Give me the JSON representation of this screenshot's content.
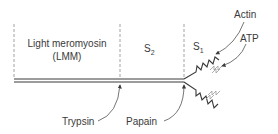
{
  "diagram": {
    "regions": [
      {
        "id": "lmm",
        "label_line1": "Light meromyosin",
        "label_line2": "(LMM)"
      },
      {
        "id": "s2",
        "label": "S",
        "subscript": "2"
      },
      {
        "id": "s1",
        "label": "S",
        "subscript": "1"
      }
    ],
    "cleavage_sites": [
      {
        "id": "trypsin",
        "label": "Trypsin"
      },
      {
        "id": "papain",
        "label": "Papain"
      }
    ],
    "binding_sites": [
      {
        "id": "actin",
        "label": "Actin"
      },
      {
        "id": "atp",
        "label": "ATP"
      }
    ],
    "colors": {
      "line": "#3a3a3a",
      "dashed": "#8a8a8a",
      "text": "#3a3a3a",
      "light_zigzag": "#9a9a9a"
    }
  }
}
